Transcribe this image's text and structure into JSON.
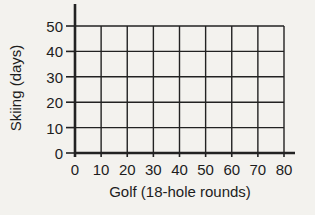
{
  "chart_data": {
    "type": "scatter",
    "title": "",
    "xlabel": "Golf (18-hole rounds)",
    "ylabel": "Skiing (days)",
    "xlim": [
      0,
      80
    ],
    "ylim": [
      0,
      50
    ],
    "x_ticks": [
      0,
      10,
      20,
      30,
      40,
      50,
      60,
      70,
      80
    ],
    "y_ticks": [
      0,
      10,
      20,
      30,
      40,
      50
    ],
    "grid": "on",
    "legend": "none",
    "series": []
  },
  "colors": {
    "line": "#222222",
    "text": "#1d1d1d",
    "background": "#f3f2ee"
  }
}
